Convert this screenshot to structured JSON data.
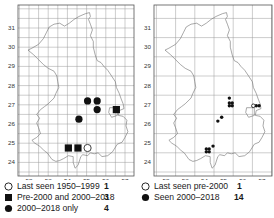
{
  "maps": [
    {
      "id": "left",
      "x_ticks": [
        "52",
        "53",
        "54",
        "55",
        "56",
        "57"
      ],
      "y_ticks": [
        "31",
        "30",
        "29",
        "28",
        "27",
        "26",
        "25",
        "24"
      ],
      "grid": "half-unit fine grid",
      "records": [
        {
          "type": "circle-filled",
          "x": 55.05,
          "y": 27.2
        },
        {
          "type": "circle-filled",
          "x": 55.55,
          "y": 27.2
        },
        {
          "type": "circle-filled",
          "x": 55.55,
          "y": 26.75
        },
        {
          "type": "circle-filled",
          "x": 54.6,
          "y": 26.25
        },
        {
          "type": "square-filled",
          "x": 56.55,
          "y": 26.75
        },
        {
          "type": "square-filled",
          "x": 54.05,
          "y": 24.75
        },
        {
          "type": "square-filled",
          "x": 54.55,
          "y": 24.75
        },
        {
          "type": "circle-open",
          "x": 55.05,
          "y": 24.75
        }
      ],
      "legend": [
        {
          "symbol": "circle-open",
          "label": "Last seen 1950–1999",
          "count": "1"
        },
        {
          "symbol": "square-filled",
          "label": "Pre-2000 and 2000–2018",
          "count": "3"
        },
        {
          "symbol": "circle-filled",
          "label": "2000–2018 only",
          "count": "4"
        }
      ]
    },
    {
      "id": "right",
      "x_ticks": [
        "52",
        "53",
        "54",
        "55",
        "56",
        "57"
      ],
      "y_ticks": [
        "31",
        "30",
        "29",
        "28",
        "27",
        "26",
        "25",
        "24"
      ],
      "grid": "unit grid",
      "records": [
        {
          "type": "dot-filled",
          "x": 55.3,
          "y": 27.35
        },
        {
          "type": "dot-filled",
          "x": 55.3,
          "y": 27.1
        },
        {
          "type": "dot-filled",
          "x": 55.45,
          "y": 27.1
        },
        {
          "type": "dot-filled",
          "x": 55.3,
          "y": 26.95
        },
        {
          "type": "dot-filled",
          "x": 55.45,
          "y": 26.95
        },
        {
          "type": "dot-filled",
          "x": 56.7,
          "y": 26.95
        },
        {
          "type": "dot-filled",
          "x": 56.85,
          "y": 26.95
        },
        {
          "type": "dot-filled",
          "x": 54.9,
          "y": 26.35
        },
        {
          "type": "dot-filled",
          "x": 54.7,
          "y": 26.15
        },
        {
          "type": "dot-filled",
          "x": 54.45,
          "y": 24.85
        },
        {
          "type": "dot-filled",
          "x": 54.1,
          "y": 24.7
        },
        {
          "type": "dot-filled",
          "x": 54.25,
          "y": 24.7
        },
        {
          "type": "dot-filled",
          "x": 54.1,
          "y": 24.55
        },
        {
          "type": "dot-filled",
          "x": 54.25,
          "y": 24.55
        },
        {
          "type": "circle-open",
          "x": 56.55,
          "y": 26.95
        }
      ],
      "legend": [
        {
          "symbol": "circle-open",
          "label": "Last seen pre-2000",
          "count": "1"
        },
        {
          "symbol": "circle-filled",
          "label": "Seen 2000–2018",
          "count": "14"
        }
      ]
    }
  ],
  "colors": {
    "frame": "#555555",
    "grid": "#9a9a9a",
    "coast": "#6e6e6e",
    "marker": "#111111",
    "background": "#ffffff"
  }
}
